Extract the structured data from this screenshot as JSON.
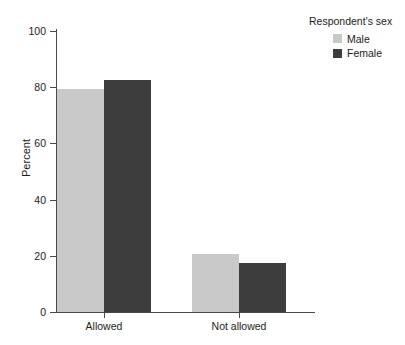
{
  "chart_data": {
    "type": "bar",
    "title": "",
    "subtitle": "",
    "xlabel": "",
    "ylabel": "Percent",
    "categories": [
      "Allowed",
      "Not allowed"
    ],
    "series": [
      {
        "name": "Male",
        "color": "#c9c9c9",
        "values": [
          79.2,
          20.8
        ]
      },
      {
        "name": "Female",
        "color": "#3d3d3d",
        "values": [
          82.6,
          17.4
        ]
      }
    ],
    "legend": {
      "title": "Respondent's sex",
      "position": "top-right",
      "entries": [
        "Male",
        "Female"
      ]
    },
    "ylim": [
      0,
      100
    ],
    "yticks": [
      0,
      20,
      40,
      60,
      80,
      100
    ],
    "ytick_labels": [
      "0",
      "20",
      "40",
      "60",
      "80",
      "100"
    ],
    "grid": false,
    "bar_grouping": "grouped",
    "colors": {
      "male": "#c9c9c9",
      "female": "#3d3d3d",
      "axis": "#4a4a4a",
      "text": "#1c1c1c",
      "background": "#ffffff"
    }
  }
}
